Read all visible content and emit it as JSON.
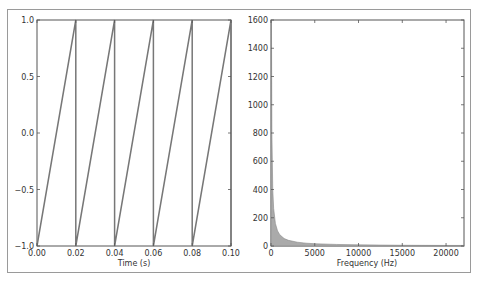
{
  "figure": {
    "left_panel": {
      "xlabel": "Time (s)",
      "xticks": [
        "0.00",
        "0.02",
        "0.04",
        "0.06",
        "0.08",
        "0.10"
      ],
      "yticks": [
        "1.0",
        "0.5",
        "0.0",
        "−0.5",
        "−1.0"
      ]
    },
    "right_panel": {
      "xlabel": "Frequency (Hz)",
      "xticks": [
        "0",
        "5000",
        "10000",
        "15000",
        "20000"
      ],
      "yticks": [
        "1600",
        "1400",
        "1200",
        "1000",
        "800",
        "600",
        "400",
        "200",
        "0"
      ]
    },
    "colors": {
      "line": "#777777",
      "fill": "#aaaaaa",
      "axes": "#555555"
    }
  },
  "chart_data": [
    {
      "type": "line",
      "title": "",
      "xlabel": "Time (s)",
      "ylabel": "",
      "xlim": [
        0.0,
        0.1
      ],
      "ylim": [
        -1.0,
        1.0
      ],
      "grid": false,
      "description": "Sawtooth wave, period 0.02 s (50 Hz), amplitude -1 to 1",
      "x": [
        0.0,
        0.02,
        0.02,
        0.04,
        0.04,
        0.06,
        0.06,
        0.08,
        0.08,
        0.1,
        0.1
      ],
      "y": [
        -1.0,
        1.0,
        -1.0,
        1.0,
        -1.0,
        1.0,
        -1.0,
        1.0,
        -1.0,
        1.0,
        -1.0
      ],
      "xticks": [
        0.0,
        0.02,
        0.04,
        0.06,
        0.08,
        0.1
      ],
      "yticks": [
        -1.0,
        -0.5,
        0.0,
        0.5,
        1.0
      ]
    },
    {
      "type": "area",
      "title": "",
      "xlabel": "Frequency (Hz)",
      "ylabel": "",
      "xlim": [
        0,
        22050
      ],
      "ylim": [
        0,
        1600
      ],
      "grid": false,
      "description": "Magnitude spectrum of sawtooth, harmonics decaying ~1/f",
      "x": [
        0,
        50,
        100,
        200,
        300,
        500,
        750,
        1000,
        1500,
        2000,
        3000,
        4000,
        5000,
        7500,
        10000,
        15000,
        20000,
        22050
      ],
      "y": [
        0,
        1600,
        800,
        400,
        267,
        160,
        107,
        80,
        53,
        40,
        27,
        20,
        16,
        11,
        8,
        5,
        4,
        4
      ],
      "xticks": [
        0,
        5000,
        10000,
        15000,
        20000
      ],
      "yticks": [
        0,
        200,
        400,
        600,
        800,
        1000,
        1200,
        1400,
        1600
      ]
    }
  ]
}
